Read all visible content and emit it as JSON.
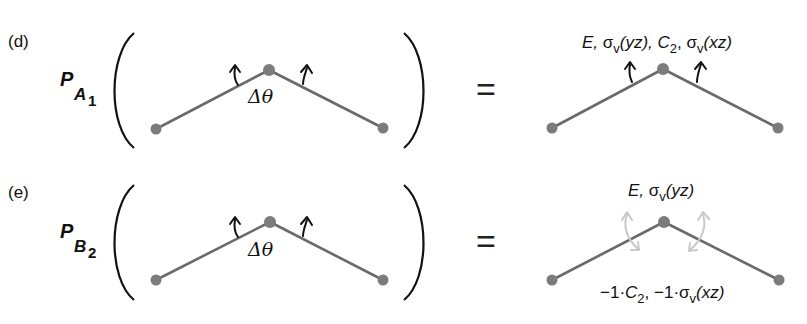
{
  "panels": [
    {
      "tag": "(d)",
      "projector": {
        "symbol": "P",
        "irrep": "A",
        "irrep_sub": "1"
      },
      "angle_label": "Δθ",
      "equals": "=",
      "result_label_top": {
        "parts": [
          "E, ",
          "σ",
          "v",
          "(yz), ",
          "C",
          "2",
          ", ",
          "σ",
          "v",
          "(xz)"
        ]
      },
      "result_label_bottom": null,
      "result_arrows": "in-phase upward (bending mode preserved)"
    },
    {
      "tag": "(e)",
      "projector": {
        "symbol": "P",
        "irrep": "B",
        "irrep_sub": "2"
      },
      "angle_label": "Δθ",
      "equals": "=",
      "result_label_top": {
        "parts": [
          "E, ",
          "σ",
          "v",
          "(yz)"
        ]
      },
      "result_label_bottom": {
        "parts": [
          "−1·",
          "C",
          "2",
          ", −1·",
          "σ",
          "v",
          "(xz)"
        ]
      },
      "result_arrows": "cancelling up/down pairs (faint)"
    }
  ],
  "colors": {
    "bond": "#6a6a6a",
    "atom": "#7c7c7c",
    "faint_arrow": "#c9c9c9",
    "text": "#111111"
  }
}
